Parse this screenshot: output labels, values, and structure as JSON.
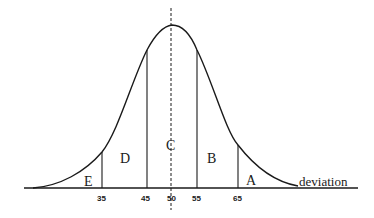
{
  "diagram": {
    "type": "normal-distribution-curve",
    "axis_label": "deviation",
    "mean_marker": 50,
    "regions": [
      {
        "id": "E",
        "label": "E",
        "range": "< 35"
      },
      {
        "id": "D",
        "label": "D",
        "range": "35-45"
      },
      {
        "id": "C",
        "label": "C",
        "range": "45-55"
      },
      {
        "id": "B",
        "label": "B",
        "range": "55-65"
      },
      {
        "id": "A",
        "label": "A",
        "range": "> 65"
      }
    ],
    "ticks": [
      "35",
      "45",
      "50",
      "55",
      "65"
    ],
    "colors": {
      "line": "#1a1a1a",
      "background": "#ffffff"
    }
  }
}
